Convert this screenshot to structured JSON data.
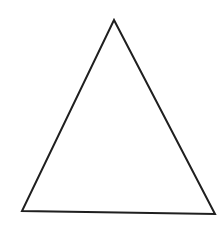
{
  "diagram": {
    "shape": "triangle",
    "background": "#ffffff",
    "stroke": "#1f1f1f",
    "stroke_width": 2,
    "fill": "none",
    "vertices": {
      "top": [
        114,
        20
      ],
      "bottom_left": [
        22,
        211
      ],
      "bottom_right": [
        215,
        214
      ]
    }
  }
}
